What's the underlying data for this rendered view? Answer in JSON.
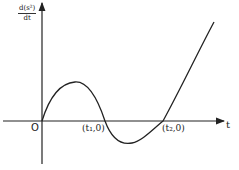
{
  "diagram": {
    "y_axis_label": {
      "numerator": "d(s²)",
      "denominator": "dt"
    },
    "x_axis_label": "t",
    "origin_label": "O",
    "points": [
      {
        "label": "(t₁,0)"
      },
      {
        "label": "(t₂,0)"
      }
    ],
    "curve_description": "Rises from origin to a local maximum, crosses t-axis at t1, dips to a local minimum, crosses t-axis at t2, then rises steeply",
    "colors": {
      "line": "#222222",
      "background": "#ffffff"
    }
  }
}
